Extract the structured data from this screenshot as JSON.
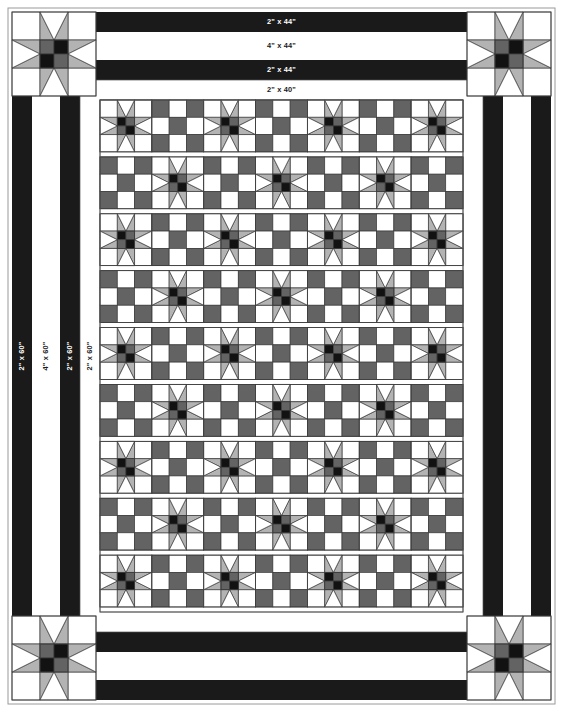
{
  "diagram": {
    "type": "quilt-layout",
    "canvas": {
      "width": 563,
      "height": 712
    }
  },
  "palette": {
    "background": "#ffffff",
    "white": "#ffffff",
    "off_white": "#fbfbfb",
    "dark": "#1a1a1a",
    "black": "#121212",
    "medium_gray": "#636363",
    "light_gray": "#b3b3b3",
    "outline": "#3a3a3a",
    "thin_outline": "#555555",
    "page_frame": "#9a9a9a"
  },
  "labels": {
    "top": [
      {
        "id": "top-outer-dark",
        "text": "2\" x 44\"",
        "on_dark": true
      },
      {
        "id": "top-wide-white",
        "text": "4\" x 44\"",
        "on_dark": false
      },
      {
        "id": "top-inner-dark",
        "text": "2\" x 44\"",
        "on_dark": true
      },
      {
        "id": "top-inner-white",
        "text": "2\" x 40\"",
        "on_dark": false
      }
    ],
    "left": [
      {
        "id": "left-outer-dark",
        "text": "2\" x 60\"",
        "on_dark": true
      },
      {
        "id": "left-wide-white",
        "text": "4\" x 60\"",
        "on_dark": false
      },
      {
        "id": "left-inner-dark",
        "text": "2\" x 60\"",
        "on_dark": true
      },
      {
        "id": "left-inner-white",
        "text": "2\" x 60\"",
        "on_dark": false
      }
    ]
  },
  "borders": [
    {
      "name": "outer-dark-border",
      "size": "2\"",
      "color": "#1a1a1a",
      "length_horizontal": "44\"",
      "length_vertical": "60\""
    },
    {
      "name": "wide-white-border",
      "size": "4\"",
      "color": "#ffffff",
      "length_horizontal": "44\"",
      "length_vertical": "60\""
    },
    {
      "name": "inner-dark-border",
      "size": "2\"",
      "color": "#1a1a1a",
      "length_horizontal": "44\"",
      "length_vertical": "60\""
    },
    {
      "name": "inner-white-border",
      "size": "2\"",
      "color": "#ffffff",
      "length_horizontal": "40\"",
      "length_vertical": "60\""
    }
  ],
  "corner_blocks": {
    "name": "sawtooth-star-corner-block",
    "count": 4,
    "positions": [
      "top-left",
      "top-right",
      "bottom-left",
      "bottom-right"
    ],
    "grid": 3,
    "center": "four-patch",
    "center_cells": [
      "medium_gray",
      "black",
      "black",
      "medium_gray"
    ],
    "point_color": "light_gray",
    "background": "white"
  },
  "body": {
    "name": "quilt-center-field",
    "columns": 7,
    "rows": 9,
    "block_types": [
      "sawtooth-star-block",
      "nine-patch-block"
    ],
    "arrangement": "alternating-checkerboard",
    "star_block": {
      "grid": 3,
      "center": "four-patch",
      "center_cells": [
        "black",
        "medium_gray",
        "medium_gray",
        "black"
      ],
      "point_color": "light_gray",
      "background": "white"
    },
    "nine_patch_block": {
      "grid": 3,
      "corner_color": "medium_gray",
      "edge_color": "white",
      "center_color": "medium_gray"
    }
  },
  "chart_data": {
    "type": "table",
    "columns": [
      "Border",
      "Cut Size",
      "Horizontal Length",
      "Vertical Length"
    ],
    "rows": [
      [
        "Outer dark border",
        "2\"",
        "44\"",
        "60\""
      ],
      [
        "Wide white border",
        "4\"",
        "44\"",
        "60\""
      ],
      [
        "Inner dark border",
        "2\"",
        "44\"",
        "60\""
      ],
      [
        "Inner white border",
        "2\"",
        "40\"",
        "60\""
      ]
    ]
  }
}
